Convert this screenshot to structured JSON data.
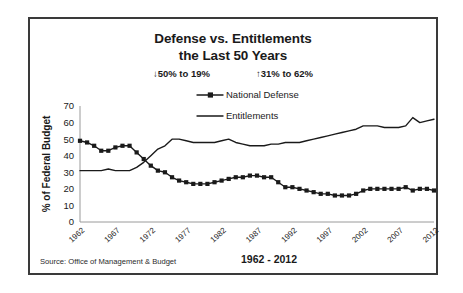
{
  "card": {
    "title_line1": "Defense vs. Entitlements",
    "title_line2": "the Last 50 Years",
    "annotation_left": "↓0% to 19%",
    "annotation_right": "↑31% to 62%",
    "source": "Source:  Office of Management & Budget"
  },
  "chart_data": {
    "type": "line",
    "title": "Defense vs. Entitlements the Last 50 Years",
    "subtitle_annotations": [
      "↓50% to 19%",
      "↑31% to 62%"
    ],
    "xlabel": "1962 - 2012",
    "ylabel": "% of Federal Budget",
    "ylim": [
      0,
      70
    ],
    "ytick_values": [
      0,
      10,
      20,
      30,
      40,
      50,
      60,
      70
    ],
    "xlim": [
      1962,
      2012
    ],
    "xtick_labels": [
      "1962",
      "1967",
      "1972",
      "1977",
      "1982",
      "1987",
      "1992",
      "1997",
      "2002",
      "2007",
      "2012"
    ],
    "grid": false,
    "legend_position": "inside-top-center",
    "x": [
      1962,
      1963,
      1964,
      1965,
      1966,
      1967,
      1968,
      1969,
      1970,
      1971,
      1972,
      1973,
      1974,
      1975,
      1976,
      1977,
      1978,
      1979,
      1980,
      1981,
      1982,
      1983,
      1984,
      1985,
      1986,
      1987,
      1988,
      1989,
      1990,
      1991,
      1992,
      1993,
      1994,
      1995,
      1996,
      1997,
      1998,
      1999,
      2000,
      2001,
      2002,
      2003,
      2004,
      2005,
      2006,
      2007,
      2008,
      2009,
      2010,
      2011,
      2012
    ],
    "series": [
      {
        "name": "National Defense",
        "marker": "square",
        "values": [
          49,
          48,
          46,
          43,
          43,
          45,
          46,
          46,
          42,
          38,
          34,
          31,
          30,
          27,
          25,
          24,
          23,
          23,
          23,
          24,
          25,
          26,
          27,
          27,
          28,
          28,
          27,
          27,
          24,
          21,
          21,
          20,
          19,
          18,
          17,
          17,
          16,
          16,
          16,
          17,
          19,
          20,
          20,
          20,
          20,
          20,
          21,
          19,
          20,
          20,
          19
        ],
        "start_value": 49,
        "end_value": 19
      },
      {
        "name": "Entitlements",
        "marker": "none",
        "values": [
          31,
          31,
          31,
          31,
          32,
          31,
          31,
          31,
          33,
          36,
          40,
          44,
          46,
          50,
          50,
          49,
          48,
          48,
          48,
          48,
          49,
          50,
          48,
          47,
          46,
          46,
          46,
          47,
          47,
          48,
          48,
          48,
          49,
          50,
          51,
          52,
          53,
          54,
          55,
          56,
          58,
          58,
          58,
          57,
          57,
          57,
          58,
          63,
          60,
          61,
          62
        ],
        "start_value": 31,
        "end_value": 62
      }
    ]
  }
}
